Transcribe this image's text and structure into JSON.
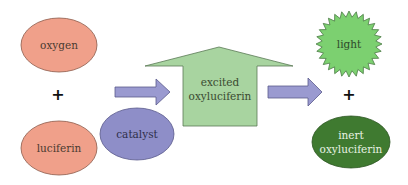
{
  "diagram": {
    "colors": {
      "reactant_fill": "#f0a08a",
      "reactant_stroke": "#8c5a4a",
      "arrow_fill": "#9a9ad0",
      "arrow_stroke": "#5a5a8c",
      "catalyst_fill": "#8e8ec8",
      "intermediate_fill": "#a8d4a0",
      "intermediate_stroke": "#5a7a55",
      "light_fill": "#7cd070",
      "light_stroke": "#4a7a44",
      "product_fill": "#3f7a30",
      "product_text": "#e8f2e4",
      "text_dark": "#4a3a30"
    },
    "nodes": {
      "oxygen": {
        "label": "oxygen"
      },
      "plus_left": {
        "label": "+"
      },
      "luciferin": {
        "label": "luciferin"
      },
      "catalyst": {
        "label": "catalyst"
      },
      "excited": {
        "line1": "excited",
        "line2": "oxyluciferin"
      },
      "light": {
        "label": "light"
      },
      "plus_right": {
        "label": "+"
      },
      "inert": {
        "line1": "inert",
        "line2": "oxyluciferin"
      }
    },
    "edges": [
      {
        "from": "reactants",
        "to": "excited oxyluciferin",
        "via": "catalyst"
      },
      {
        "from": "excited oxyluciferin",
        "to": "products"
      }
    ]
  }
}
